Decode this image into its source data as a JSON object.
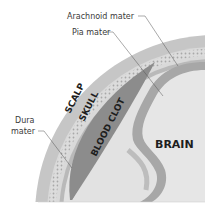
{
  "diagram": {
    "type": "anatomical-cross-section",
    "layers": [
      {
        "key": "scalp",
        "label": "SCALP",
        "color": "#c9c9c9"
      },
      {
        "key": "skull",
        "label": "SKULL",
        "color": "#dadada"
      },
      {
        "key": "dura",
        "label": "Dura mater",
        "color": "#b3b3b3"
      },
      {
        "key": "blood_clot",
        "label": "BLOOD CLOT",
        "color": "#8f8f8f"
      },
      {
        "key": "arachnoid",
        "label": "Arachnoid mater",
        "color": "#e3e3e3"
      },
      {
        "key": "pia",
        "label": "Pia mater",
        "color": "#a9a9a9"
      },
      {
        "key": "brain",
        "label": "BRAIN",
        "color": "#e6e6e6"
      }
    ],
    "callouts": {
      "arachnoid": "Arachnoid mater",
      "pia": "Pia mater",
      "dura_line1": "Dura",
      "dura_line2": "mater"
    },
    "inline_labels": {
      "scalp": "SCALP",
      "skull": "SKULL",
      "blood_clot": "BLOOD CLOT",
      "brain": "BRAIN"
    }
  }
}
